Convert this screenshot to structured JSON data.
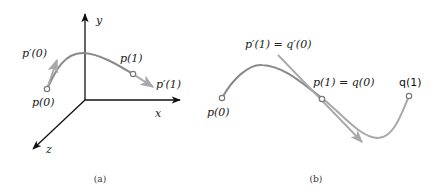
{
  "colors": {
    "axis": "#111111",
    "curve": "#8a8a8a",
    "tangent": "#a8a8a8",
    "point_fill": "#ffffff",
    "point_stroke": "#7a7a7a",
    "text": "#222222"
  },
  "panel_a": {
    "caption": "(a)",
    "axes": {
      "x_label": "x",
      "y_label": "y",
      "z_label": "z"
    },
    "labels": {
      "p0": "p(0)",
      "p1": "p(1)",
      "dp0": "p′(0)",
      "dp1": "p′(1)"
    }
  },
  "panel_b": {
    "caption": "(b)",
    "labels": {
      "p0": "p(0)",
      "p1_eq_q0": "p(1) = q(0)",
      "q1": "q(1)",
      "tangent_eq": "p′(1) = q′(0)"
    }
  }
}
